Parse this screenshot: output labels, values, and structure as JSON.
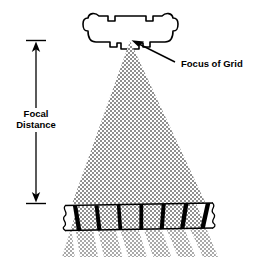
{
  "figure": {
    "domain": "diagram",
    "background_color": "#ffffff",
    "ink_color": "#000000",
    "beam_fill_color": "#a8a8a8",
    "width": 270,
    "height": 260
  },
  "labels": {
    "focal_distance_line1": "Focal",
    "focal_distance_line2": "Distance",
    "focus_of_grid": "Focus of Grid"
  },
  "components": {
    "tube_housing": {
      "name": "x-ray-tube-housing",
      "description": "Rounded rectangular tube housing with bumped corners, notched top and stepped bottom with central port"
    },
    "focal_spot": {
      "name": "focal-spot",
      "description": "Apex of the x-ray beam located inside the tube port"
    },
    "beam": {
      "name": "x-ray-beam",
      "description": "Diverging dithered cone of radiation from focal spot to grid"
    },
    "grid": {
      "name": "focused-anti-scatter-grid",
      "strip_count": 7,
      "description": "Horizontal grid slab with angled lead strips aimed at the focus, torn wavy ends"
    },
    "transmitted_beam": {
      "name": "transmitted-beam-bands",
      "band_count": 6,
      "description": "Beam segments passing below the grid between lead strips"
    },
    "dimension_arrow": {
      "name": "focal-distance-dimension",
      "description": "Vertical double headed arrow from focal spot level to grid level"
    },
    "callout_arrow": {
      "name": "focus-of-grid-callout-arrow",
      "description": "Diagonal leader arrow pointing up-left at the focal spot"
    }
  },
  "geometry": {
    "focus_x": 130,
    "focus_y": 41,
    "grid_top_y": 204,
    "grid_bottom_y": 229,
    "beam_left_at_grid": 72,
    "beam_right_at_grid": 206,
    "dim_line_x": 36,
    "dim_top_y": 40,
    "dim_bottom_y": 203
  }
}
